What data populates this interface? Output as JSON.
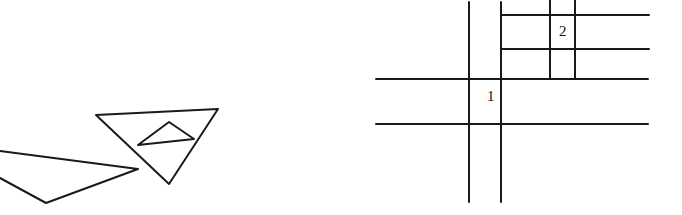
{
  "figure": {
    "left_panel": {
      "description": "Triangles",
      "shapes": [
        {
          "name": "left-triangle",
          "points": "0,151 138,169 46,203 0,178"
        },
        {
          "name": "large-triangle",
          "points": "96,115 218,109 169,184"
        },
        {
          "name": "inner-triangle",
          "points": "138,145 169,122 194,139"
        }
      ]
    },
    "right_panel": {
      "description": "Grid of lines with labeled cells",
      "vertical_lines": [
        {
          "x": 469,
          "y1": 2,
          "y2": 202
        },
        {
          "x": 501,
          "y1": 2,
          "y2": 202
        },
        {
          "x": 550,
          "y1": 0,
          "y2": 79
        },
        {
          "x": 575,
          "y1": 0,
          "y2": 79
        }
      ],
      "horizontal_lines": [
        {
          "y": 15,
          "x1": 501,
          "x2": 649
        },
        {
          "y": 49,
          "x1": 501,
          "x2": 649
        },
        {
          "y": 79,
          "x1": 376,
          "x2": 648
        },
        {
          "y": 124,
          "x1": 376,
          "x2": 648
        }
      ],
      "labels": [
        {
          "text": "1",
          "x": 487,
          "y": 89
        },
        {
          "text": "2",
          "x": 559,
          "y": 24
        }
      ]
    }
  }
}
